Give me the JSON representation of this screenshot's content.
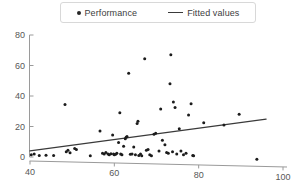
{
  "chart_data": {
    "type": "scatter",
    "title": "",
    "xlabel": "",
    "ylabel": "",
    "xlim": [
      40,
      100
    ],
    "ylim": [
      0,
      80
    ],
    "xticks": [
      40,
      60,
      80,
      100
    ],
    "yticks": [
      0,
      20,
      40,
      60,
      80
    ],
    "grid": false,
    "legend_position": "top-center",
    "series": [
      {
        "name": "Performance",
        "type": "scatter",
        "marker": "circle",
        "color": "#1c1c1c",
        "points": [
          [
            40.3,
            1.5
          ],
          [
            41.0,
            2.0
          ],
          [
            42.2,
            1.0
          ],
          [
            43.8,
            1.2
          ],
          [
            45.6,
            1.0
          ],
          [
            48.3,
            34.5
          ],
          [
            48.6,
            3.5
          ],
          [
            49.0,
            4.5
          ],
          [
            49.5,
            2.8
          ],
          [
            50.6,
            5.5
          ],
          [
            51.0,
            5.0
          ],
          [
            54.3,
            0.8
          ],
          [
            56.6,
            17.0
          ],
          [
            57.2,
            2.5
          ],
          [
            57.6,
            2.0
          ],
          [
            58.0,
            3.0
          ],
          [
            58.5,
            2.0
          ],
          [
            58.8,
            1.5
          ],
          [
            59.2,
            2.2
          ],
          [
            59.6,
            14.5
          ],
          [
            59.8,
            2.0
          ],
          [
            60.0,
            1.5
          ],
          [
            60.3,
            1.8
          ],
          [
            60.6,
            2.5
          ],
          [
            61.0,
            9.5
          ],
          [
            61.3,
            29.0
          ],
          [
            61.5,
            2.0
          ],
          [
            61.8,
            1.5
          ],
          [
            62.2,
            7.0
          ],
          [
            62.6,
            12.0
          ],
          [
            62.8,
            13.0
          ],
          [
            63.0,
            13.5
          ],
          [
            63.4,
            55.0
          ],
          [
            63.8,
            1.8
          ],
          [
            64.2,
            2.0
          ],
          [
            64.6,
            6.5
          ],
          [
            65.0,
            1.5
          ],
          [
            65.4,
            22.0
          ],
          [
            65.6,
            23.5
          ],
          [
            65.8,
            1.0
          ],
          [
            66.2,
            2.0
          ],
          [
            66.5,
            0.8
          ],
          [
            67.2,
            64.5
          ],
          [
            67.6,
            4.5
          ],
          [
            68.0,
            5.0
          ],
          [
            68.4,
            1.5
          ],
          [
            68.8,
            0.8
          ],
          [
            69.4,
            15.0
          ],
          [
            69.8,
            15.5
          ],
          [
            70.6,
            4.0
          ],
          [
            71.0,
            31.5
          ],
          [
            71.4,
            11.0
          ],
          [
            72.0,
            8.0
          ],
          [
            72.4,
            3.0
          ],
          [
            72.8,
            2.5
          ],
          [
            73.2,
            48.0
          ],
          [
            73.4,
            67.0
          ],
          [
            73.8,
            3.5
          ],
          [
            74.0,
            36.0
          ],
          [
            74.4,
            32.5
          ],
          [
            74.8,
            2.0
          ],
          [
            75.4,
            18.5
          ],
          [
            75.8,
            4.0
          ],
          [
            76.4,
            1.5
          ],
          [
            77.0,
            2.5
          ],
          [
            77.6,
            27.5
          ],
          [
            78.2,
            35.0
          ],
          [
            78.6,
            1.0
          ],
          [
            78.8,
            0.8
          ],
          [
            81.2,
            22.5
          ],
          [
            86.0,
            21.0
          ],
          [
            89.6,
            28.0
          ],
          [
            93.8,
            -1.5
          ]
        ]
      },
      {
        "name": "Fitted values",
        "type": "line",
        "color": "#3a3a3a",
        "endpoints": [
          [
            40.0,
            4.0
          ],
          [
            96.0,
            24.8
          ]
        ]
      }
    ]
  },
  "legend": {
    "performance_label": "Performance",
    "fitted_label": "Fitted values"
  }
}
